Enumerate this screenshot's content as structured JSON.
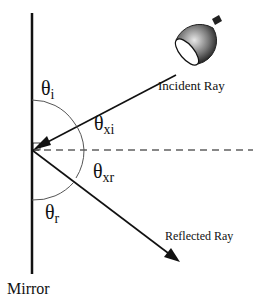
{
  "diagram": {
    "labels": {
      "theta_i": {
        "main": "θ",
        "sub": "i"
      },
      "theta_xi": {
        "main": "θ",
        "sub": "xi"
      },
      "theta_xr": {
        "main": "θ",
        "sub": "xr"
      },
      "theta_r": {
        "main": "θ",
        "sub": "r"
      },
      "incident_ray": "Incident Ray",
      "reflected_ray": "Reflected Ray",
      "mirror": "Mirror"
    },
    "colors": {
      "line": "#111111",
      "arc": "#555555",
      "lamp_dark": "#222222",
      "lamp_light": "#e8e8e8"
    }
  }
}
